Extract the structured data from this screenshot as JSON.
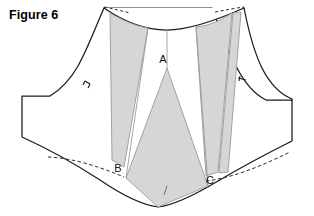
{
  "figure": {
    "caption": "Figure 6",
    "type": "sewing-pattern-diagram"
  },
  "colors": {
    "outline": "#1a1a1a",
    "wedge_fill": "#d6d6d6",
    "wedge_stroke": "#9a9a9a",
    "dashed_line": "#2b2b2b",
    "background": "#ffffff",
    "label_text": "#111111"
  },
  "labels": [
    {
      "id": "A",
      "text": "A",
      "x": 163,
      "y": 63,
      "description": "center front wedge label"
    },
    {
      "id": "B",
      "text": "B",
      "x": 118,
      "y": 172,
      "description": "left waist wedge label"
    },
    {
      "id": "C",
      "text": "C",
      "x": 210,
      "y": 184,
      "description": "right waist wedge label"
    }
  ],
  "markings": {
    "notches": [
      {
        "id": "left-armhole-notch",
        "x": 88,
        "y": 85,
        "count": 2
      },
      {
        "id": "right-armhole-notch",
        "x": 243,
        "y": 80,
        "count": 1
      },
      {
        "id": "bottom-center-notch",
        "x": 166,
        "y": 190,
        "count": 1
      }
    ],
    "dashed_segments": [
      {
        "id": "top-left-dashed",
        "description": "dashed shoulder extension top left"
      },
      {
        "id": "top-right-dashed",
        "description": "dashed shoulder extension top right"
      },
      {
        "id": "bottom-left-dashed",
        "description": "dashed original waistline left"
      },
      {
        "id": "bottom-right-dashed",
        "description": "dashed original waistline right"
      }
    ]
  },
  "wedges": [
    {
      "id": "wedge-left-outer",
      "fill": "#d6d6d6",
      "description": "left outer shaded slash wedge"
    },
    {
      "id": "wedge-center-a",
      "fill": "#d6d6d6",
      "description": "center shaded wedge at point A"
    },
    {
      "id": "wedge-right-outer",
      "fill": "#d6d6d6",
      "description": "right outer shaded slash wedge"
    },
    {
      "id": "wedge-right-inner",
      "fill": "#d6d6d6",
      "description": "right inner narrow shaded wedge"
    }
  ]
}
